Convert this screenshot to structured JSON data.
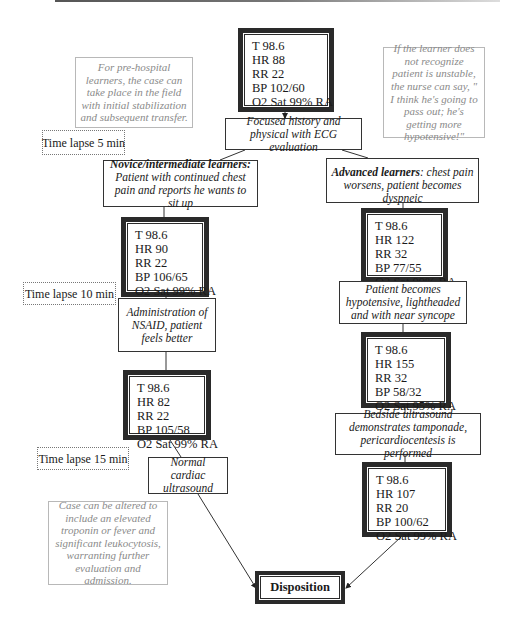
{
  "figure": {
    "type": "flowchart",
    "start_vitals": {
      "lines": [
        "T 98.6",
        "HR 88",
        "RR 22",
        "BP 102/60",
        "O2 Sat 99% RA"
      ]
    },
    "notes": {
      "prehospital": "For pre-hospital learners, the case can take place in the field with initial stabilization and subsequent transfer.",
      "nurse_prompt": "If the learner does not recognize patient is unstable, the nurse can say, \" I think he's going to pass out; he's getting more hypotensive!\"",
      "case_alteration": "Case can be altered to include an elevated troponin or fever and significant leukocytosis, warranting further evaluation and admission."
    },
    "time_lapses": {
      "t5": "Time lapse 5 min",
      "t10": "Time lapse 10 min",
      "t15": "Time lapse 15 min"
    },
    "steps": {
      "focused_history": "Focused history and physical with ECG evaluation",
      "novice": {
        "heading": "Novice/intermediate learners:",
        "body": "Patient with continued chest pain and reports he wants to sit up"
      },
      "advanced": {
        "heading": "Advanced learners",
        "body": ": chest pain worsens, patient becomes dyspneic"
      },
      "nsaid": "Administration of NSAID, patient feels better",
      "hypotensive": "Patient becomes hypotensive, lightheaded and with near syncope",
      "bedside_us": "Bedside ultrasound demonstrates tamponade, pericardiocentesis is performed",
      "normal_us": "Normal cardiac ultrasound",
      "disposition": "Disposition"
    },
    "left_branch_vitals": [
      {
        "lines": [
          "T 98.6",
          "HR 90",
          "RR 22",
          "BP 106/65",
          "O2 Sat 99% RA"
        ]
      },
      {
        "lines": [
          "T 98.6",
          "HR 82",
          "RR 22",
          "BP 105/58",
          "O2 Sat 99% RA"
        ]
      }
    ],
    "right_branch_vitals": [
      {
        "lines": [
          "T 98.6",
          "HR 122",
          "RR 32",
          "BP 77/55",
          "O2 Sat 99% RA"
        ]
      },
      {
        "lines": [
          "T 98.6",
          "HR 155",
          "RR 32",
          "BP 58/32",
          "O2 Sat 95% RA"
        ]
      },
      {
        "lines": [
          "T 98.6",
          "HR 107",
          "RR 20",
          "BP 100/62",
          "O2 Sat 99% RA"
        ]
      }
    ]
  }
}
